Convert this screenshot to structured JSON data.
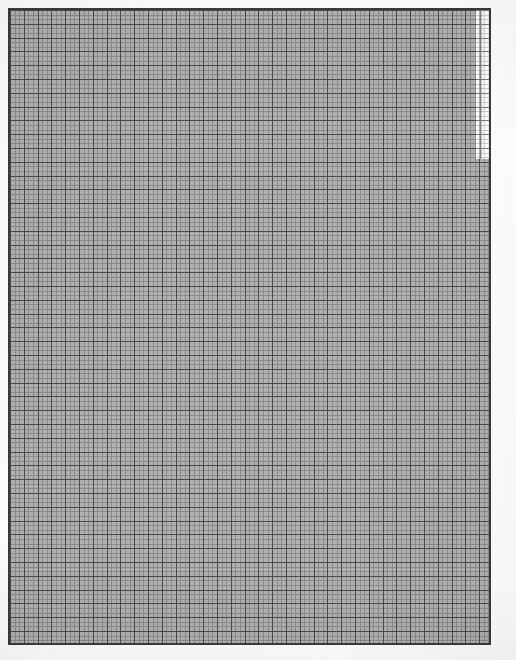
{
  "document": {
    "kind": "graph-paper-grid-sheet",
    "title": "Blank gridded graph paper sheet",
    "page_background": "#ffffff",
    "canvas_width": 516,
    "canvas_height": 660
  },
  "grid": {
    "frame": {
      "left": 8,
      "top": 8,
      "width": 483,
      "height": 637,
      "border_width": 2,
      "border_color": "#3a3a3a"
    },
    "fill_color": "#b2b2b2",
    "minor": {
      "cell_size": 4.6,
      "line_color": "#6e6e6e",
      "line_width": 1,
      "columns": 105,
      "rows": 138
    },
    "major": {
      "cell_size": 13.8,
      "line_color": "#4a4a4a",
      "line_width": 1,
      "columns": 35,
      "rows": 46,
      "minor_cells_per_major": 3
    }
  },
  "white_patch": {
    "label": "unshaded-region",
    "left": 476,
    "top": 8,
    "width": 15,
    "height": 151,
    "color": "#ffffff"
  },
  "margins": {
    "top": 8,
    "right": 25,
    "bottom": 15,
    "left": 8,
    "color": "#ffffff"
  },
  "chart_data": {
    "type": "table",
    "xlabel": "",
    "ylabel": "",
    "categories": [],
    "values": []
  }
}
